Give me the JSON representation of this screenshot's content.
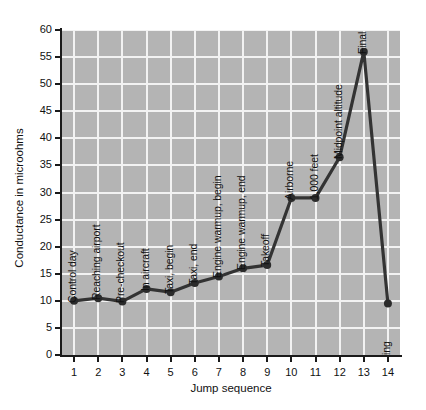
{
  "chart_data": {
    "type": "line",
    "title": "",
    "xlabel": "Jump sequence",
    "ylabel": "Conductance in microohms",
    "x": [
      1,
      2,
      3,
      4,
      5,
      6,
      7,
      8,
      9,
      10,
      11,
      12,
      13,
      14
    ],
    "values": [
      10.0,
      10.5,
      9.9,
      12.2,
      11.6,
      13.3,
      14.5,
      16.0,
      16.6,
      29.0,
      29.0,
      36.5,
      56.0,
      9.5
    ],
    "point_labels": [
      "Control day",
      "Reaching airport",
      "Pre-checkout",
      "In aircraft",
      "Taxi, begin",
      "Taxi, end",
      "Engine warmup, begin",
      "Engine warmup, end",
      "Takeoff",
      "Airborne",
      "1,000 feet",
      "Midpoint altitude",
      "Final altitude",
      "Landing"
    ],
    "xlim": [
      0.5,
      14.5
    ],
    "ylim": [
      0,
      60
    ],
    "ytick_labels": [
      "0",
      "5",
      "10",
      "15",
      "20",
      "25",
      "30",
      "35",
      "40",
      "45",
      "50",
      "55",
      "60"
    ],
    "yticks": [
      0,
      5,
      10,
      15,
      20,
      25,
      30,
      35,
      40,
      45,
      50,
      55,
      60
    ],
    "xtick_labels": [
      "1",
      "2",
      "3",
      "4",
      "5",
      "6",
      "7",
      "8",
      "9",
      "10",
      "11",
      "12",
      "13",
      "14"
    ],
    "grid": true,
    "legend": false,
    "colors": {
      "plot_background": "#b4b4b4",
      "gridline": "#f2f2f2",
      "line": "#333333",
      "marker": "#2b2b2b",
      "axis": "#1a1a1a",
      "text": "#111111",
      "page_background": "#ffffff"
    }
  }
}
